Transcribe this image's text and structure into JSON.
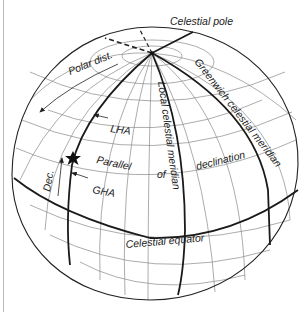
{
  "diagram": {
    "type": "celestial-sphere",
    "labels": {
      "celestial_pole": "Celestial pole",
      "polar_dist": "Polar dist.",
      "lha": "LHA",
      "local_meridian": "Local celestial meridian",
      "greenwich_meridian": "Greenwich celestial meridian",
      "parallel": "Parallel",
      "of": "of",
      "declination": "declination",
      "dec": "Dec.",
      "gha": "GHA",
      "celestial_equator": "Celestial equator"
    },
    "markers": {
      "star": "star-icon",
      "pole": "celestial-pole-point"
    },
    "colors": {
      "ink": "#1a1a1a",
      "grid": "#888888",
      "background": "#ffffff"
    }
  }
}
